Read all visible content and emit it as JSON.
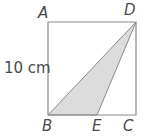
{
  "figure": {
    "name": "square-with-shaded-triangle",
    "colors": {
      "background": "#ffffff",
      "outline": "#8a8a8a",
      "shading": "#dcdcdc",
      "shading_outline": "#8a8a8a",
      "text": "#4a4a4a"
    },
    "square": {
      "name": "ABCD",
      "side_label": "10 cm",
      "top_left_px": [
        48,
        22
      ],
      "top_right_px": [
        136,
        22
      ],
      "bottom_right_px": [
        136,
        115
      ],
      "bottom_left_px": [
        48,
        115
      ],
      "path": "M48,22 L136,22 L136,115 L48,115 Z"
    },
    "shaded_triangle": {
      "name": "BED",
      "vertices": [
        "B",
        "E",
        "D"
      ],
      "b_px": [
        48,
        115
      ],
      "e_px": [
        97,
        115
      ],
      "d_px": [
        136,
        22
      ],
      "path": "M48,115 L97,115 L136,22 Z"
    },
    "labels": {
      "a": "A",
      "b": "B",
      "c": "C",
      "d": "D",
      "e": "E",
      "side_length": "10 cm"
    }
  }
}
